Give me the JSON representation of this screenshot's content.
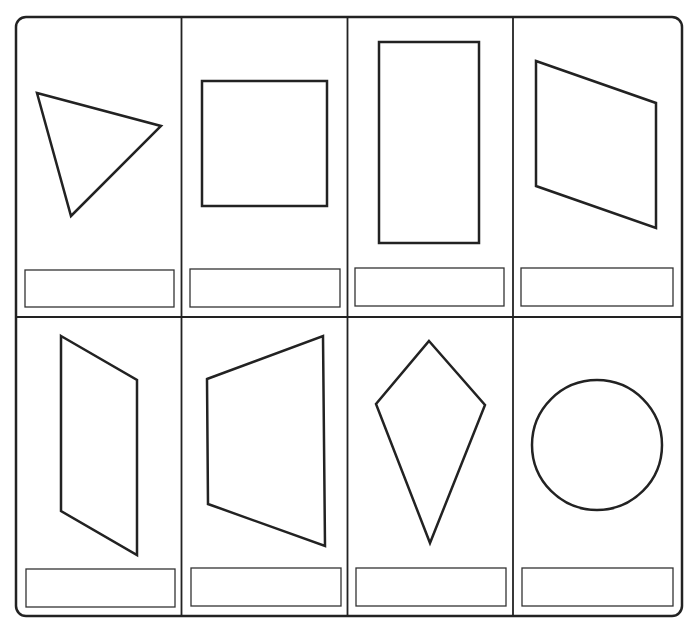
{
  "worksheet": {
    "title": "",
    "rows": 2,
    "columns": 4,
    "cards": [
      {
        "shape": "triangle",
        "answer": ""
      },
      {
        "shape": "square",
        "answer": ""
      },
      {
        "shape": "rectangle",
        "answer": ""
      },
      {
        "shape": "parallelogram",
        "answer": ""
      },
      {
        "shape": "parallelogram-vertical",
        "answer": ""
      },
      {
        "shape": "trapezoid",
        "answer": ""
      },
      {
        "shape": "kite",
        "answer": ""
      },
      {
        "shape": "circle",
        "answer": ""
      }
    ],
    "colors": {
      "ink": "#222222",
      "paper": "#ffffff"
    }
  }
}
